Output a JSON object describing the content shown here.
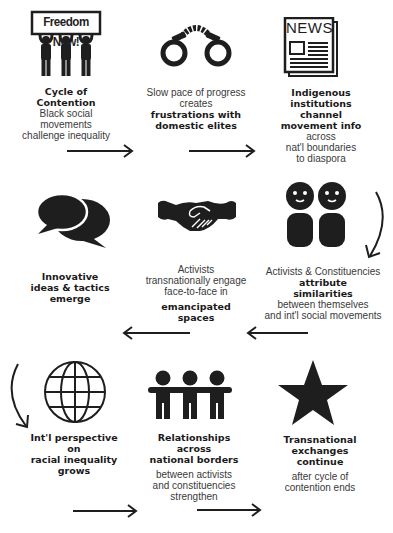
{
  "diagram": {
    "steps": [
      {
        "icon": "protest-sign-icon",
        "sign_text": "Freedom Now!",
        "title": "Cycle of Contention",
        "title_lines": [
          "Cycle of",
          "Contention"
        ],
        "description_lines": [
          "Black social",
          "movements",
          "challenge inequality"
        ]
      },
      {
        "icon": "handcuffs-icon",
        "pre_lines": [
          "Slow pace of progress",
          "creates"
        ],
        "title_lines": [
          "frustrations with",
          "domestic elites"
        ]
      },
      {
        "icon": "newspaper-icon",
        "news_label": "NEWS",
        "title_lines": [
          "Indigenous",
          "institutions",
          "channel",
          "movement info"
        ],
        "description_lines": [
          "across",
          "nat'l boundaries",
          "to diaspora"
        ]
      },
      {
        "icon": "people-pair-icon",
        "pre_lines": [
          "Activists & Constituencies"
        ],
        "title_lines": [
          "attribute",
          "similarities"
        ],
        "description_lines": [
          "between themselves",
          "and int'l social movements"
        ]
      },
      {
        "icon": "handshake-icon",
        "pre_lines": [
          "Activists",
          "transnationally  engage",
          "face-to-face in"
        ],
        "title_lines": [
          "emancipated",
          "spaces"
        ]
      },
      {
        "icon": "speech-bubbles-icon",
        "title_lines": [
          "Innovative",
          "ideas & tactics",
          "emerge"
        ]
      },
      {
        "icon": "globe-icon",
        "title_lines": [
          "Int'l perspective",
          "on",
          "racial inequality",
          "grows"
        ]
      },
      {
        "icon": "people-group-icon",
        "title_lines": [
          "Relationships",
          "across",
          "national borders"
        ],
        "description_lines": [
          "between activists",
          "and constituencies",
          "strengthen"
        ]
      },
      {
        "icon": "star-icon",
        "title_lines": [
          "Transnational",
          "exchanges",
          "continue"
        ],
        "description_lines": [
          "after cycle of",
          "contention ends"
        ]
      }
    ],
    "flow": [
      "Cycle of Contention",
      "frustrations with domestic elites",
      "Indigenous institutions channel movement info",
      "attribute similarities",
      "emancipated spaces",
      "Innovative ideas & tactics emerge",
      "Int'l perspective on racial inequality grows",
      "Relationships across national borders",
      "Transnational exchanges continue"
    ],
    "colors": {
      "ink": "#1e1e1e",
      "text_light": "#3a3a3a",
      "background": "#ffffff"
    }
  }
}
